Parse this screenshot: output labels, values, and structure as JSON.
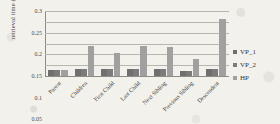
{
  "chart_data": {
    "type": "bar",
    "title": "",
    "xlabel": "",
    "ylabel": "retrieval time (sec)",
    "ylim": [
      0,
      0.3
    ],
    "yticks": [
      "0",
      "0.05",
      "0.1",
      "0.15",
      "0.2",
      "0.25",
      "0.3"
    ],
    "ytick_values": [
      0,
      0.05,
      0.1,
      0.15,
      0.2,
      0.25,
      0.3
    ],
    "grid": true,
    "legend_position": "right",
    "categories": [
      "Parent",
      "Children",
      "First Child",
      "Last Child",
      "Next Sibling",
      "Previous Sibling",
      "Descendent"
    ],
    "series": [
      {
        "name": "VP_1",
        "color": "#6f6f6f",
        "values": [
          0.03,
          0.032,
          0.031,
          0.032,
          0.031,
          0.022,
          0.031
        ]
      },
      {
        "name": "VP_2",
        "color": "#7b7b7b",
        "values": [
          0.03,
          0.032,
          0.031,
          0.032,
          0.031,
          0.022,
          0.031
        ]
      },
      {
        "name": "HP",
        "color": "#a0a0a0",
        "values": [
          0.03,
          0.14,
          0.104,
          0.139,
          0.135,
          0.08,
          0.261
        ]
      }
    ]
  }
}
